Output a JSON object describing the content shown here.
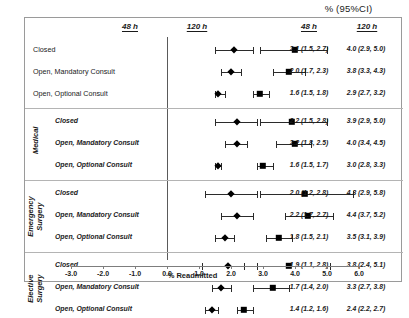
{
  "figure": {
    "super_header": "% (95%CI)",
    "x_axis_title": "% Readmitted"
  },
  "headers": {
    "plot_48": "48 h",
    "plot_120": "120 h",
    "value_48": "48 h",
    "value_120": "120 h"
  },
  "groups": [
    {
      "name": "",
      "rows": [
        {
          "label": "Closed",
          "v48": "2.1 (1.5, 2.7)",
          "v120": "4.0 (2.9, 5.0)"
        },
        {
          "label": "Open, Mandatory Consult",
          "v48": "2.0 (1.7, 2.3)",
          "v120": "3.8 (3.3, 4.3)"
        },
        {
          "label": "Open, Optional Consult",
          "v48": "1.6 (1.5, 1.8)",
          "v120": "2.9 (2.7, 3.2)"
        }
      ]
    },
    {
      "name": "Medical",
      "rows": [
        {
          "label": "Closed",
          "v48": "2.2 (1.5, 2.8)",
          "v120": "3.9 (2.9, 5.0)"
        },
        {
          "label": "Open, Mandatory Consult",
          "v48": "2.2 (1.8, 2.5)",
          "v120": "4.0 (3.4, 4.5)"
        },
        {
          "label": "Open, Optional Consult",
          "v48": "1.6 (1.5, 1.7)",
          "v120": "3.0 (2.8, 3.3)"
        }
      ]
    },
    {
      "name": "Emergency\nSurgery",
      "rows": [
        {
          "label": "Closed",
          "v48": "2.0 (1.2, 2.8)",
          "v120": "4.3 (2.9, 5.8)"
        },
        {
          "label": "Open, Mandatory Consult",
          "v48": "2.2 (1.7, 2.7)",
          "v120": "4.4 (3.7, 5.2)"
        },
        {
          "label": "Open, Optional Consult",
          "v48": "1.8 (1.5, 2.1)",
          "v120": "3.5 (3.1, 3.9)"
        }
      ]
    },
    {
      "name": "Elective\nSurgery",
      "rows": [
        {
          "label": "Closed",
          "v48": "1.9 (1.1, 2.8)",
          "v120": "3.8 (2.4, 5.1)"
        },
        {
          "label": "Open, Mandatory Consult",
          "v48": "1.7 (1.4, 2.0)",
          "v120": "3.3 (2.7, 3.8)"
        },
        {
          "label": "Open, Optional Consult",
          "v48": "1.4 (1.2, 1.6)",
          "v120": "2.4 (2.2, 2.7)"
        }
      ]
    }
  ],
  "chart_data": {
    "type": "scatter",
    "title": "",
    "xlabel": "% Readmitted",
    "ylabel": "",
    "xlim": [
      -3.0,
      6.0
    ],
    "xticks": [
      "-3.0",
      "-2.0",
      "-1.0",
      "0.0",
      "1.0",
      "2.0",
      "3.0",
      "4.0",
      "5.0",
      "6.0"
    ],
    "xtick_values": [
      -3.0,
      -2.0,
      -1.0,
      0.0,
      1.0,
      2.0,
      3.0,
      4.0,
      5.0,
      6.0
    ],
    "grid": false,
    "reference_line_x": 0.0,
    "legend": [
      "48 h",
      "120 h"
    ],
    "marker_shapes": {
      "48 h": "diamond",
      "120 h": "square"
    },
    "categories": [
      "Overall: Closed",
      "Overall: Open, Mandatory Consult",
      "Overall: Open, Optional Consult",
      "Medical: Closed",
      "Medical: Open, Mandatory Consult",
      "Medical: Open, Optional Consult",
      "Emergency Surgery: Closed",
      "Emergency Surgery: Open, Mandatory Consult",
      "Emergency Surgery: Open, Optional Consult",
      "Elective Surgery: Closed",
      "Elective Surgery: Open, Mandatory Consult",
      "Elective Surgery: Open, Optional Consult"
    ],
    "series": [
      {
        "name": "48 h",
        "values": [
          2.1,
          2.0,
          1.6,
          2.2,
          2.2,
          1.6,
          2.0,
          2.2,
          1.8,
          1.9,
          1.7,
          1.4
        ],
        "ci_low": [
          1.5,
          1.7,
          1.5,
          1.5,
          1.8,
          1.5,
          1.2,
          1.7,
          1.5,
          1.1,
          1.4,
          1.2
        ],
        "ci_high": [
          2.7,
          2.3,
          1.8,
          2.8,
          2.5,
          1.7,
          2.8,
          2.7,
          2.1,
          2.8,
          2.0,
          1.6
        ]
      },
      {
        "name": "120 h",
        "values": [
          4.0,
          3.8,
          2.9,
          3.9,
          4.0,
          3.0,
          4.3,
          4.4,
          3.5,
          3.8,
          3.3,
          2.4
        ],
        "ci_low": [
          2.9,
          3.3,
          2.7,
          2.9,
          3.4,
          2.8,
          2.9,
          3.7,
          3.1,
          2.4,
          2.7,
          2.2
        ],
        "ci_high": [
          5.0,
          4.3,
          3.2,
          5.0,
          4.5,
          3.3,
          5.8,
          5.2,
          3.9,
          5.1,
          3.8,
          2.7
        ]
      }
    ]
  }
}
